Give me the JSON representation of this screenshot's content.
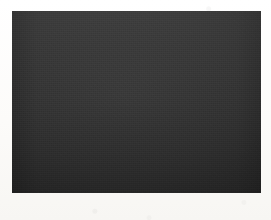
{
  "figure": {
    "caption": "(a)",
    "kind": "oscilloscope-photograph",
    "plate": {
      "x": 12,
      "y": 11,
      "width": 249,
      "height": 182,
      "screen_color": "#303030",
      "trace_color": "#f2f2ee",
      "graticule_color": "#c4c4bc"
    }
  },
  "chart_data": {
    "type": "line",
    "title": "",
    "subtitle": "",
    "xlabel": "",
    "ylabel": "",
    "annotations": [
      "(a)"
    ],
    "legend": [],
    "legend_position": "none",
    "grid": true,
    "grid_divisions_x": 10,
    "grid_divisions_y": 7,
    "xlim": [
      0,
      249
    ],
    "ylim": [
      -1,
      1
    ],
    "baseline_y": 0,
    "waveform": {
      "pre_trigger_flat_end_x": 58,
      "burst_start_x": 58,
      "peak_amplitude": 1.0,
      "decay_constant_px": 52,
      "cycles_visible": 46,
      "oscillation_period_px": 3.2,
      "envelope_top_at_start_y": -1.0,
      "envelope_bottom_at_start_y": 1.0,
      "tail_amplitude": 0.04
    },
    "series": [
      {
        "name": "damped-oscillation",
        "comment": "y = A * exp(-(x - x0)/tau) * sin(2*pi*(x - x0)/T) for x > x0, else 0",
        "x0": 58,
        "amplitude": 1.0,
        "tau": 52,
        "period": 3.2
      }
    ]
  },
  "graticule": {
    "vertical_lines_x": [
      24.9,
      49.8,
      74.7,
      99.6,
      124.5,
      149.4,
      174.3,
      199.2,
      224.1
    ],
    "horizontal_lines_y": [
      24,
      49,
      74,
      98,
      123,
      148
    ],
    "center_vertical_x": 124.5,
    "center_horizontal_y": 98,
    "ticked_axes": true
  }
}
